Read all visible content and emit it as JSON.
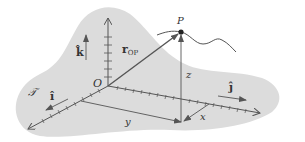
{
  "diagram": {
    "type": "3D Cartesian coordinate frame with position vector",
    "colors": {
      "plane": "#dcdcdc",
      "stroke": "#555555",
      "text": "#333333",
      "background": "#ffffff"
    },
    "labels": {
      "frame": "𝒯",
      "origin": "O",
      "point": "P",
      "vector": "r",
      "vector_subscript": "OP",
      "unit_i": "î",
      "unit_j": "ĵ",
      "unit_k": "k̂",
      "coord_x": "x",
      "coord_y": "y",
      "coord_z": "z"
    }
  }
}
